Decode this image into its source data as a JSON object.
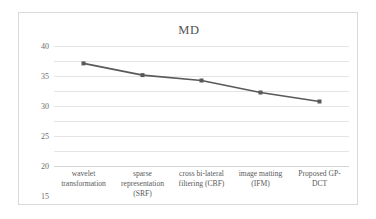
{
  "chart_data": {
    "type": "line",
    "title": "MD",
    "xlabel": "",
    "ylabel": "",
    "categories": [
      "wavelet transformation",
      "sparse representation (SRF)",
      "cross bi-lateral filtering (CBF)",
      "image matting (IFM)",
      "Proposed GP-DCT"
    ],
    "category_lines": [
      [
        "wavelet",
        "transformation"
      ],
      [
        "sparse",
        "representation",
        "(SRF)"
      ],
      [
        "cross bi-lateral",
        "filtering (CBF)"
      ],
      [
        "image matting",
        "(IFM)"
      ],
      [
        "Proposed GP-DCT"
      ]
    ],
    "values": [
      34.2,
      30.3,
      28.5,
      24.5,
      21.5
    ],
    "ylim": [
      0,
      40
    ],
    "ytick_labels": [
      "0",
      "5",
      "10",
      "15",
      "20",
      "25",
      "30",
      "35",
      "40"
    ],
    "ytick_values": [
      0,
      5,
      10,
      15,
      20,
      25,
      30,
      35,
      40
    ],
    "grid": true,
    "legend": false,
    "series_color": "#595959",
    "marker_color": "#595959",
    "gridline_color": "#e4e4e4",
    "frame_color": "#d9d9d9",
    "title_color": "#545454"
  }
}
